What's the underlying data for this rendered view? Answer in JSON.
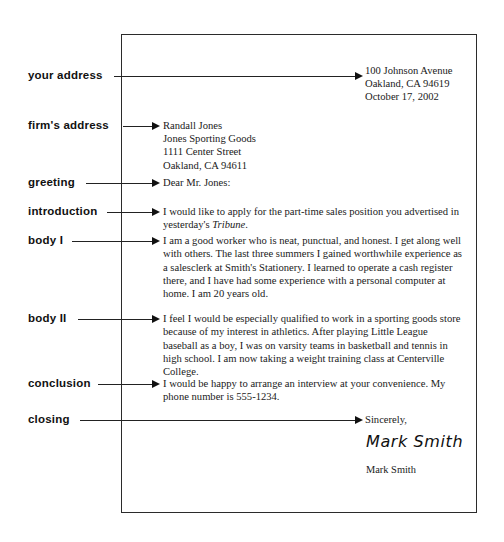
{
  "diagram": {
    "title": "Parts of a Business Letter"
  },
  "callouts": [
    {
      "id": "your-address",
      "label": "your address"
    },
    {
      "id": "firms-address",
      "label": "firm's address"
    },
    {
      "id": "greeting",
      "label": "greeting"
    },
    {
      "id": "introduction",
      "label": "introduction"
    },
    {
      "id": "body-1",
      "label": "body I"
    },
    {
      "id": "body-2",
      "label": "body II"
    },
    {
      "id": "conclusion",
      "label": "conclusion"
    },
    {
      "id": "closing",
      "label": "closing"
    }
  ],
  "letter": {
    "return_address": {
      "line1": "100 Johnson Avenue",
      "line2": "Oakland, CA  94619",
      "line3": "October 17, 2002"
    },
    "inside_address": {
      "line1": "Randall Jones",
      "line2": "Jones Sporting Goods",
      "line3": "1111 Center Street",
      "line4": "Oakland, CA 94611"
    },
    "greeting": "Dear Mr. Jones:",
    "introduction": {
      "text_before_italic": "I would like to apply for the part-time sales position you advertised in yesterday's ",
      "italic_word": "Tribune",
      "text_after_italic": "."
    },
    "body_1": "I am a good worker who is neat, punctual, and honest. I get along well with others. The last three summers I gained worthwhile experience as a salesclerk at Smith's Stationery. I learned to operate a cash register there, and I have had some experience with a personal computer at home. I am 20 years old.",
    "body_2": "I feel I would be especially qualified to work in a sporting goods store because of my interest in athletics. After playing Little League baseball as a boy, I was on varsity teams in basketball and tennis in high school. I am now taking a weight training class at Centerville College.",
    "conclusion": "I would be happy to arrange an interview at your convenience. My phone number is 555-1234.",
    "closing": "Sincerely,",
    "signature": "Mark Smith",
    "typed_name": "Mark Smith"
  },
  "colors": {
    "ink": "#1a1a1a",
    "rule": "#222222",
    "page_border": "#2b2b2b",
    "background": "#ffffff"
  }
}
